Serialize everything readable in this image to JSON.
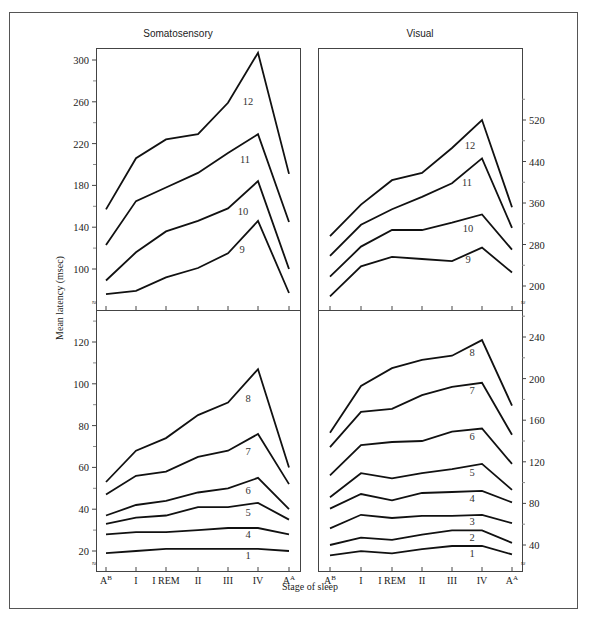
{
  "figure": {
    "ylabel": "Mean latency (msec)",
    "xlabel": "Stage of sleep",
    "stages": [
      "A^B",
      "I",
      "I REM",
      "II",
      "III",
      "IV",
      "A^A"
    ],
    "stage_display": [
      {
        "base": "A",
        "sup": "B"
      },
      {
        "base": "I",
        "sup": ""
      },
      {
        "base": "I REM",
        "sup": ""
      },
      {
        "base": "II",
        "sup": ""
      },
      {
        "base": "III",
        "sup": ""
      },
      {
        "base": "IV",
        "sup": ""
      },
      {
        "base": "A",
        "sup": "A"
      }
    ],
    "panel_titles": {
      "left": "Somatosensory",
      "right": "Visual"
    }
  },
  "chart_data": [
    {
      "type": "line",
      "title": "Somatosensory (components 9-12)",
      "panel": "top-left",
      "xlabel": "Stage of sleep",
      "ylabel": "Mean latency (msec)",
      "categories": [
        "A^B",
        "I",
        "I REM",
        "II",
        "III",
        "IV",
        "A^A"
      ],
      "yticks": [
        100,
        140,
        180,
        220,
        260,
        300
      ],
      "ylim": [
        75,
        310
      ],
      "series": [
        {
          "name": "12",
          "values": [
            157,
            206,
            224,
            229,
            259,
            307,
            191
          ]
        },
        {
          "name": "11",
          "values": [
            123,
            165,
            178,
            192,
            211,
            229,
            145
          ]
        },
        {
          "name": "10",
          "values": [
            89,
            116,
            136,
            146,
            158,
            184,
            100
          ]
        },
        {
          "name": "9",
          "values": [
            76,
            79,
            92,
            101,
            115,
            146,
            77
          ]
        }
      ]
    },
    {
      "type": "line",
      "title": "Visual (components 9-12)",
      "panel": "top-right",
      "xlabel": "Stage of sleep",
      "ylabel": "Mean latency (msec)",
      "categories": [
        "A^B",
        "I",
        "I REM",
        "II",
        "III",
        "IV",
        "A^A"
      ],
      "yticks": [
        200,
        280,
        360,
        440,
        520
      ],
      "ylim": [
        175,
        620
      ],
      "series": [
        {
          "name": "12",
          "values": [
            296,
            357,
            404,
            418,
            466,
            520,
            352
          ]
        },
        {
          "name": "11",
          "values": [
            258,
            318,
            348,
            372,
            398,
            446,
            312
          ]
        },
        {
          "name": "10",
          "values": [
            218,
            276,
            308,
            308,
            322,
            338,
            270
          ]
        },
        {
          "name": "9",
          "values": [
            180,
            238,
            256,
            252,
            248,
            274,
            226
          ]
        }
      ]
    },
    {
      "type": "line",
      "title": "Somatosensory (components 1, 4-8)",
      "panel": "bottom-left",
      "xlabel": "Stage of sleep",
      "ylabel": "Mean latency (msec)",
      "categories": [
        "A^B",
        "I",
        "I REM",
        "II",
        "III",
        "IV",
        "A^A"
      ],
      "yticks": [
        20,
        40,
        60,
        80,
        100,
        120
      ],
      "ylim": [
        10,
        135
      ],
      "series": [
        {
          "name": "8",
          "values": [
            53,
            68,
            74,
            85,
            91,
            107,
            60
          ]
        },
        {
          "name": "7",
          "values": [
            47,
            56,
            58,
            65,
            68,
            76,
            52
          ]
        },
        {
          "name": "6",
          "values": [
            37,
            42,
            44,
            48,
            50,
            55,
            40
          ]
        },
        {
          "name": "5",
          "values": [
            33,
            36,
            37,
            41,
            41,
            43,
            35
          ]
        },
        {
          "name": "4",
          "values": [
            28,
            29,
            29,
            30,
            31,
            31,
            28
          ]
        },
        {
          "name": "1",
          "values": [
            19,
            20,
            21,
            21,
            21,
            21,
            20
          ]
        }
      ]
    },
    {
      "type": "line",
      "title": "Visual (components 1-8)",
      "panel": "bottom-right",
      "xlabel": "Stage of sleep",
      "ylabel": "Mean latency (msec)",
      "categories": [
        "A^B",
        "I",
        "I REM",
        "II",
        "III",
        "IV",
        "A^A"
      ],
      "yticks": [
        40,
        80,
        120,
        160,
        200,
        240
      ],
      "ylim": [
        20,
        265
      ],
      "series": [
        {
          "name": "8",
          "values": [
            148,
            193,
            210,
            218,
            222,
            237,
            174
          ]
        },
        {
          "name": "7",
          "values": [
            134,
            168,
            171,
            184,
            192,
            196,
            146
          ]
        },
        {
          "name": "6",
          "values": [
            107,
            136,
            139,
            140,
            149,
            152,
            118
          ]
        },
        {
          "name": "5",
          "values": [
            86,
            109,
            104,
            109,
            113,
            118,
            93
          ]
        },
        {
          "name": "4",
          "values": [
            75,
            89,
            83,
            90,
            91,
            92,
            81
          ]
        },
        {
          "name": "3",
          "values": [
            56,
            69,
            66,
            68,
            68,
            69,
            61
          ]
        },
        {
          "name": "2",
          "values": [
            40,
            47,
            45,
            50,
            54,
            54,
            42
          ]
        },
        {
          "name": "1",
          "values": [
            30,
            34,
            32,
            36,
            39,
            39,
            31
          ]
        }
      ]
    }
  ]
}
